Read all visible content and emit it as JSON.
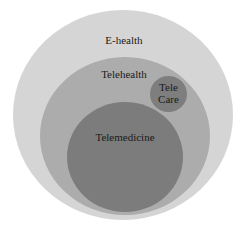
{
  "diagram": {
    "type": "nested-venn",
    "nodes": [
      {
        "id": "ehealth",
        "label": "E-health",
        "color": "#d6d6d6"
      },
      {
        "id": "telehealth",
        "label": "Telehealth",
        "color": "#ababab",
        "parent": "ehealth"
      },
      {
        "id": "telemedicine",
        "label": "Telemedicine",
        "color": "#7d7d7d",
        "parent": "telehealth"
      },
      {
        "id": "telecare",
        "label_line1": "Tele",
        "label_line2": "Care",
        "color": "#7f7f7f",
        "parent": "telehealth"
      }
    ]
  }
}
